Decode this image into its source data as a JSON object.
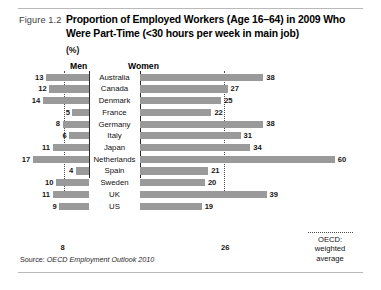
{
  "figure": {
    "number": "Figure 1.2",
    "title": "Proportion of Employed Workers (Age 16–64) in 2009 Who Were Part-Time (<30 hours per week in main job)",
    "unit": "(%)",
    "source_prefix": "Source:",
    "source_italic": "OECD Employment Outlook 2010"
  },
  "panels": {
    "men_heading": "Men",
    "women_heading": "Women"
  },
  "legend": {
    "line1": "OECD:",
    "line2": "weighted",
    "line3": "average"
  },
  "axis_labels": {
    "men_average": "8",
    "women_average": "26"
  },
  "chart_data": {
    "type": "bar",
    "title": "Proportion of Employed Workers (Age 16–64) in 2009 Who Were Part-Time (<30 hours per week in main job)",
    "subtitle": "",
    "xlabel": "",
    "ylabel": "",
    "unit": "%",
    "orientation": "horizontal",
    "layout": "back-to-back bidirectional (men left, women right)",
    "grid": false,
    "legend_position": "bottom-right",
    "reference_lines": [
      {
        "series": "Men",
        "label": "OECD: weighted average",
        "value": 8,
        "style": "dotted"
      },
      {
        "series": "Women",
        "label": "OECD: weighted average",
        "value": 26,
        "style": "dotted"
      }
    ],
    "categories": [
      "Australia",
      "Canada",
      "Denmark",
      "France",
      "Germany",
      "Italy",
      "Japan",
      "Netherlands",
      "Spain",
      "Sweden",
      "UK",
      "US"
    ],
    "series": [
      {
        "name": "Men",
        "values": [
          13,
          12,
          14,
          5,
          8,
          6,
          11,
          17,
          4,
          10,
          11,
          9
        ]
      },
      {
        "name": "Women",
        "values": [
          38,
          27,
          25,
          22,
          38,
          31,
          34,
          60,
          21,
          20,
          39,
          19
        ]
      }
    ],
    "xlim_men": [
      0,
      20
    ],
    "xlim_women": [
      0,
      62
    ],
    "bar_color": "#9a9a9a"
  }
}
